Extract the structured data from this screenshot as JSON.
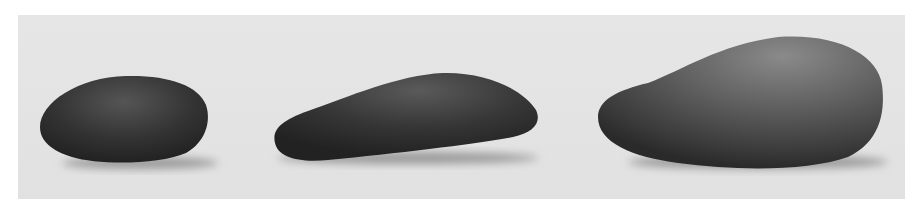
{
  "image": {
    "description": "Grayscale photograph of three smooth stones on a light gray surface",
    "background_color": "#e4e4e4",
    "border_color": "#ffffff",
    "objects": [
      {
        "name": "stone-left",
        "shape": "rounded oval pebble",
        "tone": "#3a3a3a"
      },
      {
        "name": "stone-middle",
        "shape": "elongated flat triangular pebble",
        "tone": "#3c3c3c"
      },
      {
        "name": "stone-right",
        "shape": "large pear-shaped stone",
        "tone": "#555555"
      }
    ]
  }
}
